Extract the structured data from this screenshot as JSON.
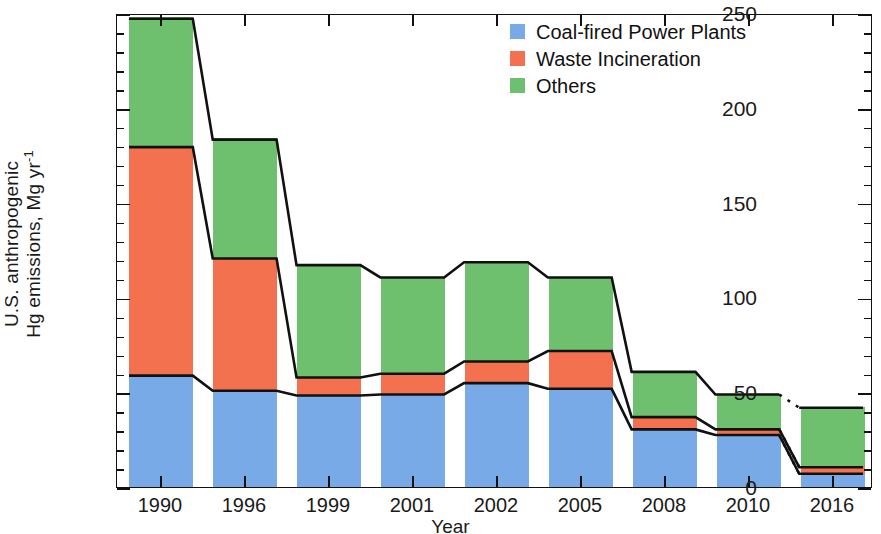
{
  "chart_data": {
    "type": "bar",
    "stacked": true,
    "title": "",
    "xlabel": "Year",
    "ylabel": "U.S. anthropogenic Hg emissions, Mg yr-1",
    "ylabel_line1": "U.S. anthropogenic",
    "ylabel_line2_a": "Hg emissions, Mg yr",
    "ylabel_line2_sup": "-1",
    "categories": [
      "1990",
      "1996",
      "1999",
      "2001",
      "2002",
      "2005",
      "2008",
      "2010",
      "2016"
    ],
    "ylim": [
      0,
      250
    ],
    "yticks": [
      0,
      50,
      100,
      150,
      200,
      250
    ],
    "ytick_labels": [
      "0",
      "50",
      "100",
      "150",
      "200",
      "250"
    ],
    "yminor_step": 10,
    "grid": false,
    "legend_position": "top-right",
    "series": [
      {
        "name": "Coal-fired Power Plants",
        "color": "#78aae8",
        "values": [
          59,
          51,
          48.5,
          49,
          55,
          52,
          30.5,
          27.5,
          7
        ]
      },
      {
        "name": "Waste Incineration",
        "color": "#f4714f",
        "values": [
          121,
          70,
          9.5,
          11,
          11.5,
          20,
          6.5,
          3,
          3.5
        ]
      },
      {
        "name": "Others",
        "color": "#6ec06e",
        "values": [
          68,
          63,
          59.5,
          51,
          52.5,
          39,
          24,
          18.5,
          31.5
        ]
      }
    ],
    "totals": [
      248,
      184,
      117.5,
      111,
      119,
      111,
      61,
      49,
      42
    ],
    "connector_lines": [
      {
        "name": "total-outline",
        "style": "solid",
        "note": "black line tracing tops of stacks, dashed between 2010 and 2016"
      },
      {
        "name": "coal-outline",
        "style": "solid"
      },
      {
        "name": "coal-plus-waste-outline",
        "style": "solid"
      }
    ]
  },
  "legend": {
    "items": [
      {
        "label": "Coal-fired Power Plants",
        "color": "#78aae8"
      },
      {
        "label": "Waste Incineration",
        "color": "#f4714f"
      },
      {
        "label": "Others",
        "color": "#6ec06e"
      }
    ]
  },
  "axes": {
    "x_title": "Year",
    "y_title_line1": "U.S. anthropogenic",
    "y_title_line2": "Hg emissions, Mg yr",
    "y_title_exponent": "-1"
  }
}
